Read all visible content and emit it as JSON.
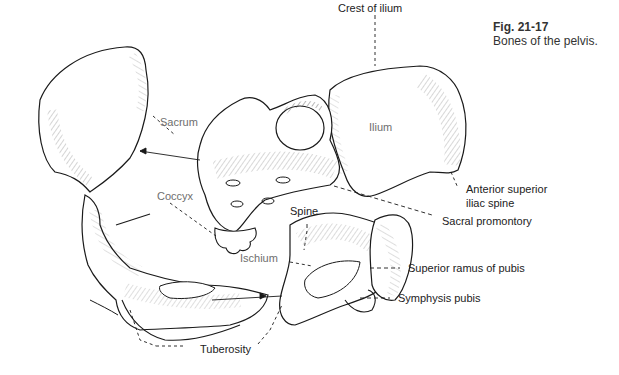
{
  "caption": {
    "figure_number": "Fig. 21-17",
    "title": "Bones of the pelvis."
  },
  "labels": {
    "crest_of_ilium": "Crest of ilium",
    "ilium": "Ilium",
    "sacrum": "Sacrum",
    "coccyx": "Coccyx",
    "spine": "Spine",
    "ischium": "Ischium",
    "anterior_superior_iliac_spine_line1": "Anterior superior",
    "anterior_superior_iliac_spine_line2": "iliac spine",
    "sacral_promontory": "Sacral promontory",
    "superior_ramus_of_pubis": "Superior ramus of pubis",
    "symphysis_pubis": "Symphysis pubis",
    "tuberosity": "Tuberosity"
  },
  "colors": {
    "line": "#1a1a1a",
    "inner_label": "#6e6e6e",
    "outer_label": "#222222"
  }
}
